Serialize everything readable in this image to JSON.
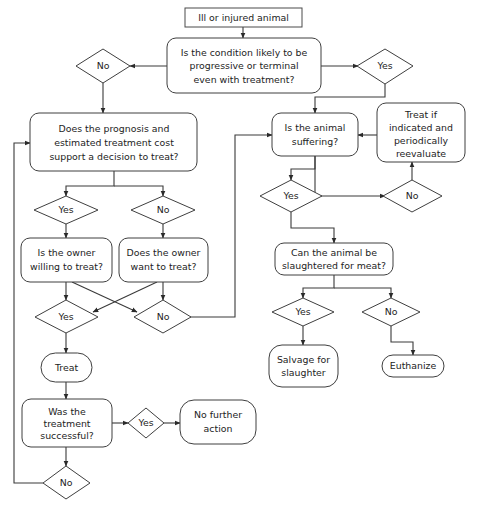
{
  "diagram": {
    "background_color": "#ffffff",
    "line_color": "#3a3a3a",
    "text_color": "#1d1d1d",
    "nodes": {
      "start": {
        "label": "Ill or injured animal",
        "shape": "rectangle"
      },
      "condition": {
        "label_line1": "Is the condition likely to be",
        "label_line2": "progressive or terminal",
        "label_line3": "even with treatment?",
        "shape": "rounded-rectangle"
      },
      "condition_no": {
        "label": "No",
        "shape": "diamond"
      },
      "condition_yes": {
        "label": "Yes",
        "shape": "diamond"
      },
      "prognosis": {
        "label_line1": "Does the prognosis and",
        "label_line2": "estimated treatment cost",
        "label_line3": "support a decision to treat?",
        "shape": "rounded-rectangle"
      },
      "prognosis_yes": {
        "label": "Yes",
        "shape": "diamond"
      },
      "prognosis_no": {
        "label": "No",
        "shape": "diamond"
      },
      "owner_willing": {
        "label_line1": "Is the owner",
        "label_line2": "willing to treat?",
        "shape": "rounded-rectangle"
      },
      "owner_want": {
        "label_line1": "Does the owner",
        "label_line2": "want to treat?",
        "shape": "rounded-rectangle"
      },
      "owner_yes": {
        "label": "Yes",
        "shape": "diamond"
      },
      "owner_no": {
        "label": "No",
        "shape": "diamond"
      },
      "treat": {
        "label": "Treat",
        "shape": "stadium"
      },
      "treatment_successful": {
        "label_line1": "Was the",
        "label_line2": "treatment",
        "label_line3": "successful?",
        "shape": "rounded-rectangle"
      },
      "successful_yes": {
        "label": "Yes",
        "shape": "diamond"
      },
      "successful_no": {
        "label": "No",
        "shape": "diamond"
      },
      "no_further_action": {
        "label_line1": "No further",
        "label_line2": "action",
        "shape": "stadium"
      },
      "suffering": {
        "label_line1": "Is the animal",
        "label_line2": "suffering?",
        "shape": "rounded-rectangle"
      },
      "treat_if_indicated": {
        "label_line1": "Treat if",
        "label_line2": "indicated and",
        "label_line3": "periodically",
        "label_line4": "reevaluate",
        "shape": "rounded-rectangle"
      },
      "suffering_yes": {
        "label": "Yes",
        "shape": "diamond"
      },
      "suffering_no": {
        "label": "No",
        "shape": "diamond"
      },
      "slaughtered": {
        "label_line1": "Can the animal be",
        "label_line2": "slaughtered for meat?",
        "shape": "rounded-rectangle"
      },
      "slaughter_yes": {
        "label": "Yes",
        "shape": "diamond"
      },
      "slaughter_no": {
        "label": "No",
        "shape": "diamond"
      },
      "salvage": {
        "label_line1": "Salvage for",
        "label_line2": "slaughter",
        "shape": "stadium"
      },
      "euthanize": {
        "label": "Euthanize",
        "shape": "stadium"
      }
    }
  }
}
